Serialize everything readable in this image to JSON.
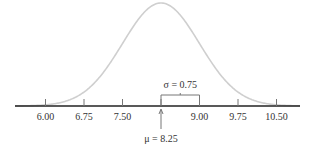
{
  "chart_data": {
    "type": "line",
    "mean": 8.25,
    "sd": 0.75,
    "x_ticks": [
      "6.00",
      "6.75",
      "7.50",
      "9.00",
      "9.75",
      "10.50"
    ],
    "x_tick_values": [
      6.0,
      6.75,
      7.5,
      8.25,
      9.0,
      9.75,
      10.5
    ],
    "xlim": [
      5.45,
      11.05
    ],
    "annotations": {
      "sigma_label": "σ = 0.75",
      "mu_label": "μ = 8.25"
    },
    "curve_color": "#cfcfcf",
    "axis_color": "#222222",
    "grid": false
  }
}
